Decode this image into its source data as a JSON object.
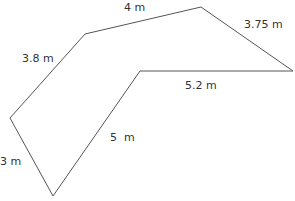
{
  "diagram": {
    "type": "polygon",
    "unit": "m",
    "stroke_color": "#555555",
    "vertices": [
      {
        "x": 85,
        "y": 34
      },
      {
        "x": 201,
        "y": 7
      },
      {
        "x": 293,
        "y": 71
      },
      {
        "x": 140,
        "y": 71
      },
      {
        "x": 53,
        "y": 196
      },
      {
        "x": 10,
        "y": 118
      }
    ],
    "labels": {
      "top": "4 m",
      "top_right": "3.75 m",
      "upper_left": "3.8 m",
      "inner_horizontal": "5.2 m",
      "inner_diagonal": "5  m",
      "lower_left": "3 m"
    }
  }
}
